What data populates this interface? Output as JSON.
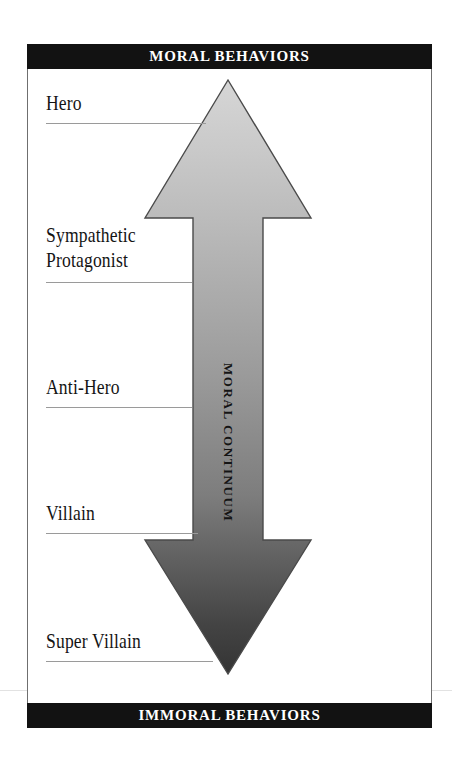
{
  "diagram": {
    "title_top": "MORAL BEHAVIORS",
    "title_bottom": "IMMORAL BEHAVIORS",
    "axis_label": "MORAL CONTINUUM",
    "colors": {
      "banner_bg": "#121212",
      "banner_text": "#ffffff",
      "arrow_top": "#cfcfcf",
      "arrow_bottom": "#3a3a3a",
      "arrow_outline": "#4a4a4a",
      "rule": "#9a9a9a",
      "frame_border": "#6f6f6f",
      "page_bg": "#ffffff"
    },
    "stages": [
      {
        "label": "Hero",
        "rule_width": 160
      },
      {
        "label": "Sympathetic\nProtagonist",
        "rule_width": 146
      },
      {
        "label": "Anti-Hero",
        "rule_width": 146
      },
      {
        "label": "Villain",
        "rule_width": 152
      },
      {
        "label": "Super Villain",
        "rule_width": 167
      }
    ]
  }
}
